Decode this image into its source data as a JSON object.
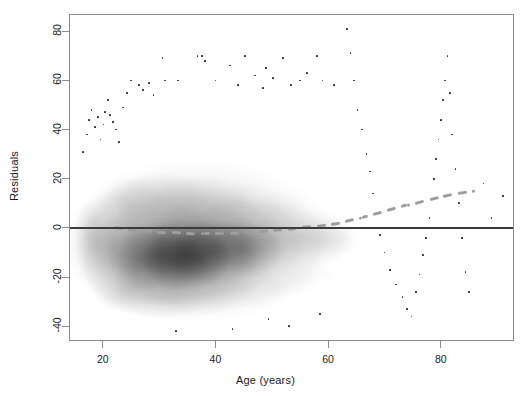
{
  "figure": {
    "type": "scatter-density",
    "background": "#ffffff",
    "frame_color": "#8c8c8c",
    "point_color": "#2b2b2b",
    "zero_line_color": "#3b3b3b",
    "smoother_color": "#9d9d9d",
    "caption": ""
  },
  "labels": {
    "xlabel": "Age (years)",
    "ylabel": "Residuals"
  },
  "axes": {
    "x_ticks": [
      "20",
      "40",
      "60",
      "80"
    ],
    "y_ticks": [
      "80",
      "60",
      "40",
      "20",
      "0",
      "-20",
      "-40"
    ]
  },
  "chart_data": {
    "type": "scatter",
    "title": "",
    "xlabel": "Age (years)",
    "ylabel": "Residuals",
    "xlim": [
      14,
      93
    ],
    "ylim": [
      -46,
      87
    ],
    "grid": false,
    "legend": null,
    "xtick_values": [
      20,
      40,
      60,
      80
    ],
    "ytick_values": [
      80,
      60,
      40,
      20,
      0,
      -20,
      -40
    ],
    "reference_lines": [
      {
        "orientation": "horizontal",
        "value": 0,
        "style": "solid",
        "color": "#3b3b3b"
      }
    ],
    "smoother": {
      "name": "lowess smoother",
      "style": "dashed",
      "color": "#9d9d9d",
      "x": [
        22,
        26,
        30,
        34,
        38,
        42,
        46,
        50,
        54,
        58,
        62,
        66,
        70,
        74,
        78,
        82,
        86
      ],
      "y": [
        0.2,
        -1.0,
        -1.8,
        -2.2,
        -2.4,
        -2.2,
        -1.8,
        -1.2,
        -0.4,
        0.6,
        2.0,
        4.2,
        6.6,
        9.2,
        11.6,
        13.6,
        15.0
      ]
    },
    "density_cloud": {
      "x_range": [
        16,
        62
      ],
      "y_range": [
        -42,
        32
      ],
      "peak_x_range": [
        26,
        48
      ],
      "peak_y_range": [
        -24,
        8
      ],
      "shading": "greyscale, darker = higher point density"
    },
    "outlier_points": [
      {
        "x": 16.5,
        "y": 31
      },
      {
        "x": 17.2,
        "y": 38
      },
      {
        "x": 17.6,
        "y": 44
      },
      {
        "x": 18.0,
        "y": 48
      },
      {
        "x": 18.6,
        "y": 41
      },
      {
        "x": 19.2,
        "y": 45
      },
      {
        "x": 19.6,
        "y": 36
      },
      {
        "x": 20.1,
        "y": 42
      },
      {
        "x": 20.4,
        "y": 47
      },
      {
        "x": 20.9,
        "y": 52
      },
      {
        "x": 21.3,
        "y": 46
      },
      {
        "x": 21.8,
        "y": 43
      },
      {
        "x": 22.4,
        "y": 40
      },
      {
        "x": 22.9,
        "y": 35
      },
      {
        "x": 23.6,
        "y": 49
      },
      {
        "x": 24.3,
        "y": 55
      },
      {
        "x": 25.0,
        "y": 60
      },
      {
        "x": 26.4,
        "y": 58
      },
      {
        "x": 27.1,
        "y": 56
      },
      {
        "x": 28.2,
        "y": 59
      },
      {
        "x": 29.0,
        "y": 54
      },
      {
        "x": 30.6,
        "y": 69
      },
      {
        "x": 31.0,
        "y": 60
      },
      {
        "x": 33.4,
        "y": 60
      },
      {
        "x": 36.8,
        "y": 70
      },
      {
        "x": 37.6,
        "y": 70
      },
      {
        "x": 38.2,
        "y": 68
      },
      {
        "x": 40.0,
        "y": 60
      },
      {
        "x": 42.6,
        "y": 66
      },
      {
        "x": 44.0,
        "y": 58
      },
      {
        "x": 45.2,
        "y": 70
      },
      {
        "x": 47.0,
        "y": 62
      },
      {
        "x": 48.4,
        "y": 57
      },
      {
        "x": 49.0,
        "y": 65
      },
      {
        "x": 50.2,
        "y": 61
      },
      {
        "x": 52.0,
        "y": 69
      },
      {
        "x": 53.4,
        "y": 58
      },
      {
        "x": 55.0,
        "y": 60
      },
      {
        "x": 56.2,
        "y": 63
      },
      {
        "x": 58.0,
        "y": 70
      },
      {
        "x": 59.0,
        "y": 60
      },
      {
        "x": 61.0,
        "y": 58
      },
      {
        "x": 63.4,
        "y": 81
      },
      {
        "x": 64.0,
        "y": 71
      },
      {
        "x": 64.6,
        "y": 60
      },
      {
        "x": 65.2,
        "y": 48
      },
      {
        "x": 66.0,
        "y": 40
      },
      {
        "x": 66.8,
        "y": 30
      },
      {
        "x": 67.4,
        "y": 23
      },
      {
        "x": 68.0,
        "y": 14
      },
      {
        "x": 68.6,
        "y": 6
      },
      {
        "x": 69.2,
        "y": -3
      },
      {
        "x": 70.0,
        "y": -10
      },
      {
        "x": 71.0,
        "y": -17
      },
      {
        "x": 72.0,
        "y": -23
      },
      {
        "x": 73.2,
        "y": -28
      },
      {
        "x": 74.0,
        "y": -33
      },
      {
        "x": 74.8,
        "y": -36
      },
      {
        "x": 75.6,
        "y": -26
      },
      {
        "x": 76.2,
        "y": -19
      },
      {
        "x": 76.8,
        "y": -11
      },
      {
        "x": 77.4,
        "y": -4
      },
      {
        "x": 78.0,
        "y": 4
      },
      {
        "x": 78.4,
        "y": 12
      },
      {
        "x": 78.8,
        "y": 20
      },
      {
        "x": 79.2,
        "y": 28
      },
      {
        "x": 79.6,
        "y": 36
      },
      {
        "x": 80.0,
        "y": 44
      },
      {
        "x": 80.4,
        "y": 52
      },
      {
        "x": 80.8,
        "y": 60
      },
      {
        "x": 81.2,
        "y": 70
      },
      {
        "x": 81.6,
        "y": 55
      },
      {
        "x": 82.0,
        "y": 38
      },
      {
        "x": 82.6,
        "y": 24
      },
      {
        "x": 83.2,
        "y": 10
      },
      {
        "x": 83.8,
        "y": -4
      },
      {
        "x": 84.4,
        "y": -18
      },
      {
        "x": 85.0,
        "y": -26
      },
      {
        "x": 86.0,
        "y": 0
      },
      {
        "x": 87.6,
        "y": 18
      },
      {
        "x": 89.0,
        "y": 4
      },
      {
        "x": 91.0,
        "y": 13
      },
      {
        "x": 58.6,
        "y": -35
      },
      {
        "x": 49.4,
        "y": -37
      },
      {
        "x": 53.0,
        "y": -40
      },
      {
        "x": 43.0,
        "y": -41
      },
      {
        "x": 33.0,
        "y": -42
      }
    ]
  }
}
